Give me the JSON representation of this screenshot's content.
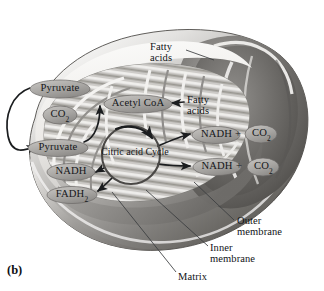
{
  "figure": {
    "label": "(b)",
    "style": "grayscale textbook illustration"
  },
  "colors": {
    "background": "#ffffff",
    "outer_membrane_light": "#f2f1ef",
    "outer_membrane_mid": "#b9b7b4",
    "outer_membrane_dark": "#6e6c6a",
    "outer_membrane_shadow": "#4a4846",
    "matrix_fill": "#c9c7c4",
    "cristae_light": "#efeeec",
    "cristae_dark": "#a3a19e",
    "interior_dark": "#7c7a77",
    "oval_fill": "#a8a6a3",
    "oval_stroke": "#6b6967",
    "arrow": "#1b1d1f",
    "text": "#16181a",
    "leader_line": "#3a3c3e"
  },
  "molecules": [
    {
      "id": "pyruvate-outer",
      "label": "Pyruvate",
      "sub": "",
      "x": 30,
      "y": 81,
      "w": 60,
      "h": 17,
      "location": "cytosol-outside"
    },
    {
      "id": "co2-upper-left",
      "label": "CO",
      "sub": "2",
      "x": 43,
      "y": 107,
      "w": 34,
      "h": 17,
      "location": "matrix"
    },
    {
      "id": "pyruvate-inner",
      "label": "Pyruvate",
      "sub": "",
      "x": 28,
      "y": 140,
      "w": 60,
      "h": 16,
      "location": "matrix"
    },
    {
      "id": "acetyl-coa",
      "label": "Acetyl CoA",
      "sub": "",
      "x": 104,
      "y": 96,
      "w": 68,
      "h": 17,
      "location": "matrix"
    },
    {
      "id": "nadh-left",
      "label": "NADH",
      "sub": "",
      "x": 47,
      "y": 164,
      "w": 48,
      "h": 16,
      "location": "matrix"
    },
    {
      "id": "fadh2-left",
      "label": "FADH",
      "sub": "2",
      "x": 47,
      "y": 187,
      "w": 50,
      "h": 16,
      "location": "matrix"
    },
    {
      "id": "nadh-upper-right",
      "label": "NADH",
      "sub": "",
      "x": 193,
      "y": 127,
      "w": 47,
      "h": 16,
      "location": "matrix"
    },
    {
      "id": "co2-upper-right",
      "label": "CO",
      "sub": "2",
      "x": 245,
      "y": 126,
      "w": 33,
      "h": 17,
      "location": "matrix"
    },
    {
      "id": "nadh-lower-right",
      "label": "NADH",
      "sub": "",
      "x": 193,
      "y": 159,
      "w": 48,
      "h": 16,
      "location": "matrix"
    },
    {
      "id": "co2-lower-right",
      "label": "CO",
      "sub": "2",
      "x": 247,
      "y": 159,
      "w": 33,
      "h": 17,
      "location": "matrix"
    }
  ],
  "plus_signs": [
    {
      "id": "plus-upper-right",
      "label": "+",
      "x": 235,
      "y": 128
    },
    {
      "id": "plus-lower-right",
      "label": "+",
      "x": 236,
      "y": 160
    }
  ],
  "cycle": {
    "id": "citric-acid-cycle",
    "line1": "Citric acid",
    "line2": "Cycle",
    "cx": 131,
    "cy": 155,
    "r": 29
  },
  "callouts": [
    {
      "id": "fatty-acids-top",
      "lines": [
        "Fatty",
        "acids"
      ],
      "x": 150,
      "y": 42,
      "align": "left"
    },
    {
      "id": "fatty-acids-inner",
      "lines": [
        "Fatty",
        "acids"
      ],
      "x": 187,
      "y": 95,
      "align": "left"
    },
    {
      "id": "outer-membrane",
      "lines": [
        "Outer",
        "membrane"
      ],
      "x": 237,
      "y": 216,
      "align": "left"
    },
    {
      "id": "inner-membrane",
      "lines": [
        "Inner",
        "membrane"
      ],
      "x": 210,
      "y": 243,
      "align": "left"
    },
    {
      "id": "matrix",
      "lines": [
        "Matrix"
      ],
      "x": 178,
      "y": 272,
      "align": "left"
    }
  ],
  "arrows": [
    {
      "id": "arrow-pyruvate-import",
      "from": "pyruvate-outer",
      "to": "pyruvate-inner"
    },
    {
      "id": "arrow-pyruvate-to-acetylcoa",
      "from": "pyruvate-inner",
      "to": "acetyl-coa"
    },
    {
      "id": "arrow-fattyacids-to-acetylcoa",
      "from": "fatty-acids-inner",
      "to": "acetyl-coa"
    },
    {
      "id": "arrow-cycle-to-nadh-upper",
      "from": "citric-acid-cycle",
      "to": "nadh-upper-right"
    },
    {
      "id": "arrow-cycle-to-nadh-lower",
      "from": "citric-acid-cycle",
      "to": "nadh-lower-right"
    },
    {
      "id": "arrow-cycle-to-nadh-left",
      "from": "citric-acid-cycle",
      "to": "nadh-left"
    },
    {
      "id": "arrow-cycle-to-fadh2",
      "from": "citric-acid-cycle",
      "to": "fadh2-left"
    },
    {
      "id": "arrow-cycle-rotation",
      "from": "citric-acid-cycle",
      "to": "citric-acid-cycle"
    }
  ]
}
